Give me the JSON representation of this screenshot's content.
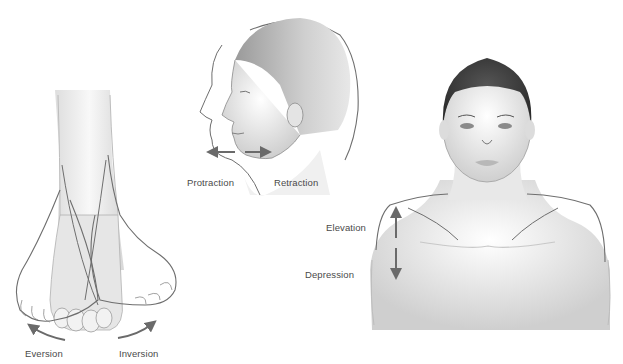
{
  "illustration": {
    "panels": [
      {
        "id": "foot",
        "subject": "foot-anterior-view",
        "labels": [
          "Eversion",
          "Inversion"
        ]
      },
      {
        "id": "head",
        "subject": "head-lateral-view",
        "labels": [
          "Protraction",
          "Retraction"
        ]
      },
      {
        "id": "shoulders",
        "subject": "head-and-shoulders-anterior-view",
        "labels": [
          "Elevation",
          "Depression"
        ]
      }
    ],
    "labels": {
      "eversion": "Eversion",
      "inversion": "Inversion",
      "protraction": "Protraction",
      "retraction": "Retraction",
      "elevation": "Elevation",
      "depression": "Depression"
    },
    "colors": {
      "background": "#ffffff",
      "outline": "#6e6e6e",
      "arrow": "#6a6a6a",
      "text": "#4a4a4a",
      "hair": "#3a3a3a",
      "shading": "#d9d9d9"
    }
  }
}
